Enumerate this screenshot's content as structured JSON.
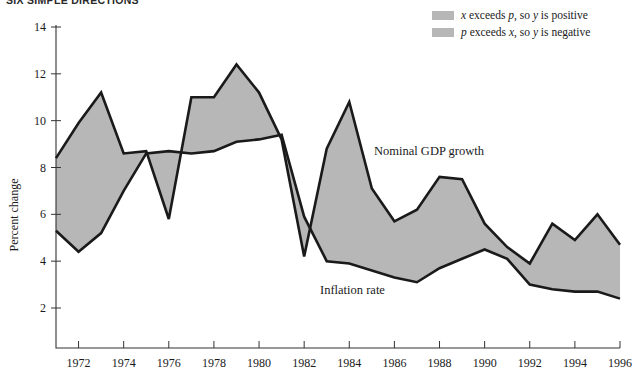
{
  "running_head": "SIX SIMPLE DIRECTIONS",
  "legend": {
    "items": [
      {
        "swatch_color": "#b7b7b7",
        "text_plain": "x exceeds p, so y is positive",
        "parts": [
          "x",
          " exceeds ",
          "p",
          ", so ",
          "y",
          " is positive"
        ]
      },
      {
        "swatch_color": "#b7b7b7",
        "text_plain": "p exceeds x, so y is negative",
        "parts": [
          "p",
          " exceeds ",
          "x",
          ", so ",
          "y",
          " is negative"
        ]
      }
    ]
  },
  "annotations": {
    "gdp_label": "Nominal GDP growth",
    "inflation_label": "Inflation rate"
  },
  "colors": {
    "band_fill": "#b7b7b7",
    "line_stroke": "#1a1a1a",
    "axis": "#333333",
    "background": "#ffffff"
  },
  "chart_data": {
    "type": "line",
    "title": "",
    "subtitle": "",
    "xlabel": "",
    "ylabel": "Percent change",
    "xlim": [
      1971,
      1996
    ],
    "ylim": [
      0,
      14
    ],
    "grid": false,
    "legend_position": "top-right",
    "x_tick_labels": [
      "1972",
      "1974",
      "1976",
      "1978",
      "1980",
      "1982",
      "1984",
      "1986",
      "1988",
      "1990",
      "1992",
      "1994",
      "1996"
    ],
    "x_ticks": [
      1972,
      1974,
      1976,
      1978,
      1980,
      1982,
      1984,
      1986,
      1988,
      1990,
      1992,
      1994,
      1996
    ],
    "y_tick_labels": [
      "2",
      "4",
      "6",
      "8",
      "10",
      "12",
      "14"
    ],
    "y_ticks": [
      2,
      4,
      6,
      8,
      10,
      12,
      14
    ],
    "x": [
      1971,
      1972,
      1973,
      1974,
      1975,
      1976,
      1977,
      1978,
      1979,
      1980,
      1981,
      1982,
      1983,
      1984,
      1985,
      1986,
      1987,
      1988,
      1989,
      1990,
      1991,
      1992,
      1993,
      1994,
      1995,
      1996
    ],
    "series": [
      {
        "name": "Nominal GDP growth",
        "values": [
          8.4,
          9.9,
          11.2,
          8.6,
          8.7,
          5.8,
          11.0,
          11.0,
          12.4,
          11.2,
          9.2,
          4.2,
          8.8,
          10.8,
          7.1,
          5.7,
          6.2,
          7.6,
          7.5,
          5.6,
          4.6,
          3.9,
          5.6,
          4.9,
          6.0,
          4.7
        ]
      },
      {
        "name": "Inflation rate",
        "values": [
          5.3,
          4.4,
          5.2,
          7.0,
          8.6,
          8.7,
          8.6,
          8.7,
          9.1,
          9.2,
          9.4,
          5.9,
          4.0,
          3.9,
          3.6,
          3.3,
          3.1,
          3.7,
          4.1,
          4.5,
          4.1,
          3.0,
          2.8,
          2.7,
          2.7,
          2.4
        ]
      }
    ],
    "band_note": "Shaded region between Nominal GDP growth and Inflation rate curves"
  }
}
